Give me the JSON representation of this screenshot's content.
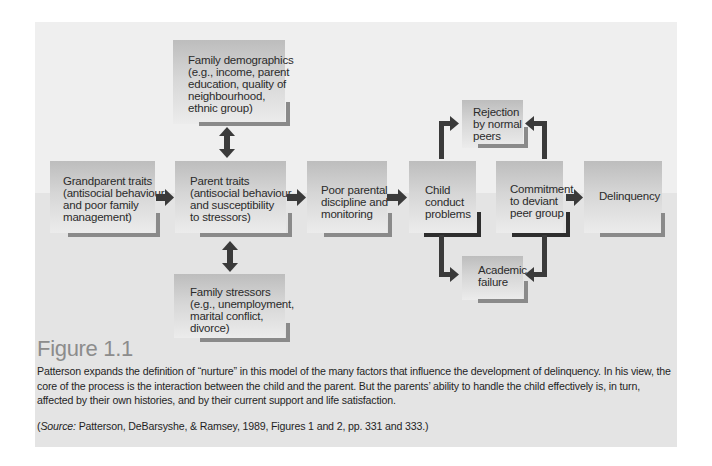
{
  "diagram": {
    "nodes": {
      "family_demographics": "Family demographics\n(e.g., income, parent\neducation, quality of\nneighbourhood,\nethnic group)",
      "grandparent_traits": "Grandparent traits\n(antisocial behaviour\nand poor family\nmanagement)",
      "parent_traits": "Parent traits\n(antisocial behaviour\nand susceptibility\nto stressors)",
      "poor_parental": "Poor parental\ndiscipline and\nmonitoring",
      "child_conduct": "Child\nconduct\nproblems",
      "commitment_deviant": "Commitment\nto deviant\npeer group",
      "delinquency": "Delinquency",
      "rejection_peers": "Rejection\nby normal\npeers",
      "academic_failure": "Academic\nfailure",
      "family_stressors": "Family stressors\n(e.g., unemployment,\nmarital conflict,\ndivorce)"
    },
    "edges": [
      {
        "from": "grandparent_traits",
        "to": "parent_traits",
        "type": "arrow"
      },
      {
        "from": "parent_traits",
        "to": "poor_parental",
        "type": "arrow"
      },
      {
        "from": "poor_parental",
        "to": "child_conduct",
        "type": "arrow"
      },
      {
        "from": "commitment_deviant",
        "to": "delinquency",
        "type": "arrow"
      },
      {
        "from": "family_demographics",
        "to": "parent_traits",
        "type": "bidirectional"
      },
      {
        "from": "family_stressors",
        "to": "parent_traits",
        "type": "bidirectional"
      },
      {
        "from": "child_conduct",
        "to": "rejection_peers",
        "type": "elbow-arrow"
      },
      {
        "from": "commitment_deviant",
        "to": "rejection_peers",
        "type": "elbow-arrow"
      },
      {
        "from": "child_conduct",
        "to": "academic_failure",
        "type": "elbow-arrow"
      },
      {
        "from": "commitment_deviant",
        "to": "academic_failure",
        "type": "elbow-arrow"
      }
    ]
  },
  "caption": {
    "title": "Figure 1.1",
    "body": "Patterson expands the definition of “nurture” in this model of the many factors that influence the development of delinquency. In his view, the core of the process is the interaction between the child and the parent. But the parents’ ability to handle the child effectively is, in turn, affected by their own histories, and by their current support and life satisfaction.",
    "source_label": "Source:",
    "source_text": " Patterson, DeBarsyshe, & Ramsey, 1989, Figures 1 and 2, pp. 331 and 333.)",
    "source_open": "("
  },
  "colors": {
    "background_top": "#efefef",
    "background_bottom": "#e4e4e4",
    "arrow": "#3a3a3a",
    "bracket_gray": "#8a8a8a",
    "bracket_dark": "#2e2e2e",
    "title_gray": "#8c8c8c"
  }
}
